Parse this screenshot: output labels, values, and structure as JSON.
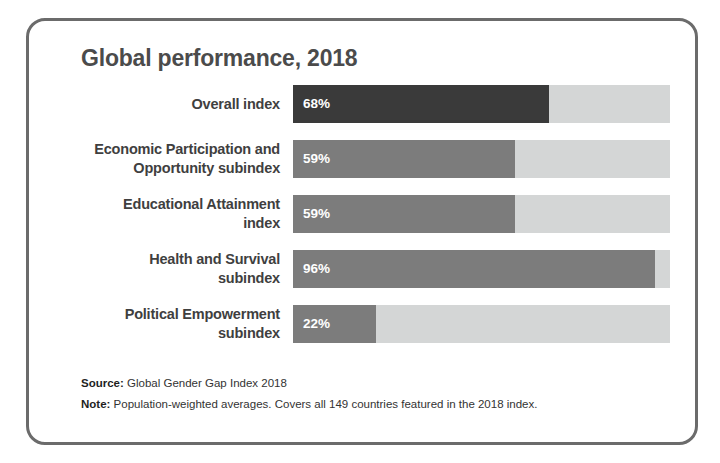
{
  "card": {
    "title": "Global performance, 2018",
    "border_color": "#6b6b6b"
  },
  "footer": {
    "source_key": "Source:",
    "source_text": " Global Gender Gap Index 2018",
    "note_key": "Note:",
    "note_text": " Population-weighted averages. Covers all 149 countries featured in the 2018 index."
  },
  "colors": {
    "track": "#d4d6d6",
    "fill_dark": "#3a3a3a",
    "fill_medium": "#7c7c7c",
    "title": "#4b4b4b",
    "label": "#3f3f3f",
    "value": "#ffffff"
  },
  "chart_data": {
    "type": "bar",
    "orientation": "horizontal",
    "title": "Global performance, 2018",
    "xlabel": "",
    "ylabel": "",
    "xlim": [
      0,
      100
    ],
    "unit": "%",
    "grid": false,
    "legend": "none",
    "categories": [
      "Overall index",
      "Economic Participation and Opportunity subindex",
      "Educational Attainment index",
      "Health and Survival subindex",
      "Political Empowerment subindex"
    ],
    "values": [
      68,
      59,
      59,
      96,
      22
    ],
    "data_labels": [
      "68%",
      "59%",
      "59%",
      "96%",
      "22%"
    ],
    "bars": [
      {
        "label_lines": [
          "Overall index"
        ],
        "value": 68,
        "value_label": "68%",
        "color": "#3a3a3a"
      },
      {
        "label_lines": [
          "Economic Participation and",
          "Opportunity subindex"
        ],
        "value": 59,
        "value_label": "59%",
        "color": "#7c7c7c"
      },
      {
        "label_lines": [
          "Educational Attainment",
          "index"
        ],
        "value": 59,
        "value_label": "59%",
        "color": "#7c7c7c"
      },
      {
        "label_lines": [
          "Health and Survival",
          "subindex"
        ],
        "value": 96,
        "value_label": "96%",
        "color": "#7c7c7c"
      },
      {
        "label_lines": [
          "Political Empowerment",
          "subindex"
        ],
        "value": 22,
        "value_label": "22%",
        "color": "#7c7c7c"
      }
    ]
  }
}
